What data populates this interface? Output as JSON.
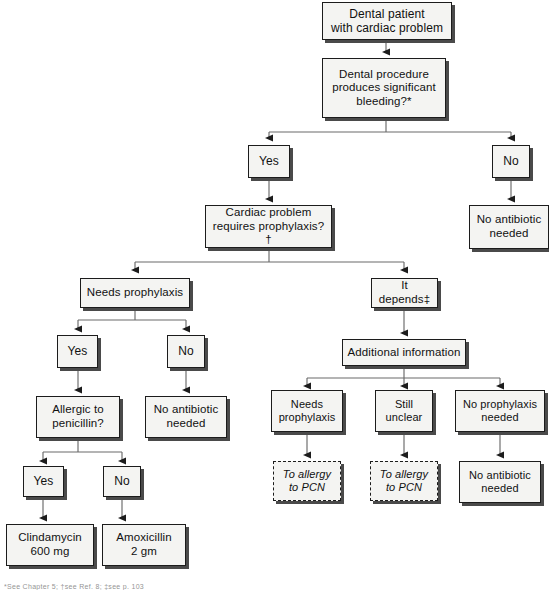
{
  "figure": {
    "background_color": "#ffffff",
    "node_fill": "#f4f4f2",
    "node_border": "#1c1c1c",
    "shadow_color": "#4a4a4a"
  },
  "nodes": {
    "start": "Dental patient\nwith cardiac problem",
    "bleeding_q": "Dental procedure\nproduces significant\nbleeding?*",
    "bleeding_yes": "Yes",
    "bleeding_no": "No",
    "no_abx_right": "No antibiotic\nneeded",
    "cardiac_q": "Cardiac problem\nrequires prophylaxis?†",
    "needs_prophylaxis": "Needs prophylaxis",
    "it_depends": "It depends‡",
    "np_yes": "Yes",
    "np_no": "No",
    "no_abx_mid": "No antibiotic\nneeded",
    "allergic_q": "Allergic to\npenicillin?",
    "allergy_yes": "Yes",
    "allergy_no": "No",
    "clindamycin": "Clindamycin\n600 mg",
    "amoxicillin": "Amoxicillin\n2 gm",
    "additional_info": "Additional information",
    "ai_needs": "Needs\nprophylaxis",
    "ai_unclear": "Still\nunclear",
    "ai_no_prophylaxis": "No prophylaxis\nneeded",
    "to_pcn_1": "To allergy\nto PCN",
    "to_pcn_2": "To allergy\nto PCN",
    "no_abx_bottom": "No antibiotic\nneeded"
  },
  "footnotes": {
    "line": "*See Chapter 5; †see Ref. 8; ‡see p. 103"
  }
}
